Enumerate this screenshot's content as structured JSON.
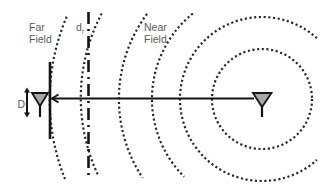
{
  "diagram": {
    "labels": {
      "far_field": [
        "Far",
        "Field"
      ],
      "near_field": [
        "Near",
        "Field"
      ],
      "boundary_distance": {
        "main": "d",
        "sub": "r"
      },
      "aperture_size": "D"
    },
    "elements": {
      "transmitter_antenna": "right antenna (wave source)",
      "receiver_antenna": "left antenna with aperture D",
      "wavefronts": "concentric dotted circular wavefronts centered on transmitter",
      "boundary_line": "dash-dot vertical line at distance d_r",
      "propagation_arrow": "horizontal arrow from transmitter to receiver"
    },
    "colors": {
      "background": "#ffffff",
      "lines": "#141414",
      "wavefront_dots": "#262626",
      "antenna_fill": "#a8a8a8",
      "text": "#5a5a5a"
    }
  }
}
